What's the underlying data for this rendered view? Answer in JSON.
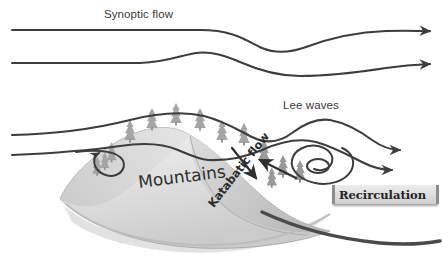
{
  "figure": {
    "title_visible": false,
    "background": "#ffffff",
    "labels": {
      "synoptic_flow": "Synoptic flow",
      "lee_waves": "Lee waves",
      "mountains": "Mountains",
      "katabatic_flow": "Katabatic flow",
      "recirculation": "Recirculation"
    },
    "colors": {
      "streamline": "#3d3d3d",
      "text": "#3a3a3a",
      "mountain_light": "#e8e8e8",
      "mountain_mid": "#d2d2d2",
      "mountain_dark": "#b4b4b4",
      "tree": "#a8a8a8",
      "ground": "#4a4a4a",
      "plate_face": "#dcdcdc",
      "plate_edge": "#8d8d8d"
    },
    "elements": [
      {
        "name": "synoptic-streamline-1",
        "kind": "streamline",
        "arrow": "right"
      },
      {
        "name": "synoptic-streamline-2",
        "kind": "streamline",
        "arrow": "right"
      },
      {
        "name": "ridge-streamline-3",
        "kind": "streamline",
        "arrow": "right"
      },
      {
        "name": "lee-wave-streamline-4",
        "kind": "streamline",
        "arrow": "right"
      },
      {
        "name": "windward-rotor-curl",
        "kind": "vortex",
        "arrow": "down"
      },
      {
        "name": "lee-rotor-spiral",
        "kind": "vortex",
        "arrow": "none"
      },
      {
        "name": "katabatic-downslope-arrow",
        "kind": "arrow",
        "arrow": "down-right"
      },
      {
        "name": "return-flow-arrow",
        "kind": "arrow",
        "arrow": "up-left"
      },
      {
        "name": "mountain-massif",
        "kind": "terrain"
      },
      {
        "name": "ground-line",
        "kind": "terrain"
      },
      {
        "name": "ridge-trees",
        "kind": "vegetation",
        "count": 7
      },
      {
        "name": "lee-slope-trees",
        "kind": "vegetation",
        "count": 4
      },
      {
        "name": "windward-trees",
        "kind": "vegetation",
        "count": 2
      }
    ]
  }
}
